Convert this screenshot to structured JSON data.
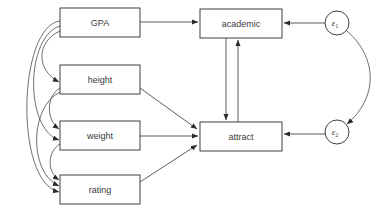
{
  "diagram": {
    "type": "path-diagram",
    "title": "",
    "background_color": "#ffffff",
    "stroke_color": "#4a4a4a",
    "text_color": "#3a3a3a",
    "box_fill": "#ffffff"
  },
  "nodes": {
    "gpa": {
      "label": "GPA",
      "shape": "rectangle",
      "x": 60,
      "y": 8,
      "w": 80,
      "h": 29
    },
    "height": {
      "label": "height",
      "shape": "rectangle",
      "x": 60,
      "y": 65,
      "w": 80,
      "h": 29
    },
    "weight": {
      "label": "weight",
      "shape": "rectangle",
      "x": 60,
      "y": 121,
      "w": 80,
      "h": 29
    },
    "rating": {
      "label": "rating",
      "shape": "rectangle",
      "x": 60,
      "y": 175,
      "w": 80,
      "h": 29
    },
    "academic": {
      "label": "academic",
      "shape": "rectangle",
      "x": 200,
      "y": 9,
      "w": 82,
      "h": 29
    },
    "attract": {
      "label": "attract",
      "shape": "rectangle",
      "x": 200,
      "y": 122,
      "w": 82,
      "h": 29
    },
    "e1": {
      "label": "ε",
      "subscript": "1",
      "shape": "circle",
      "cx": 337,
      "cy": 23,
      "r": 12
    },
    "e2": {
      "label": "ε",
      "subscript": "2",
      "shape": "circle",
      "cx": 337,
      "cy": 132,
      "r": 12
    }
  },
  "edges": {
    "directed": [
      {
        "name": "gpa-to-academic",
        "from": "gpa",
        "to": "academic"
      },
      {
        "name": "height-to-attract",
        "from": "height",
        "to": "attract"
      },
      {
        "name": "weight-to-attract",
        "from": "weight",
        "to": "attract"
      },
      {
        "name": "rating-to-attract",
        "from": "rating",
        "to": "attract"
      },
      {
        "name": "academic-to-attract",
        "from": "academic",
        "to": "attract"
      },
      {
        "name": "attract-to-academic",
        "from": "attract",
        "to": "academic"
      },
      {
        "name": "e1-to-academic",
        "from": "e1",
        "to": "academic"
      },
      {
        "name": "e2-to-attract",
        "from": "e2",
        "to": "attract"
      }
    ],
    "covariances": [
      {
        "name": "cov-gpa-height",
        "between": [
          "gpa",
          "height"
        ]
      },
      {
        "name": "cov-gpa-weight",
        "between": [
          "gpa",
          "weight"
        ]
      },
      {
        "name": "cov-gpa-rating",
        "between": [
          "gpa",
          "rating"
        ]
      },
      {
        "name": "cov-height-weight",
        "between": [
          "height",
          "weight"
        ]
      },
      {
        "name": "cov-height-rating",
        "between": [
          "height",
          "rating"
        ]
      },
      {
        "name": "cov-weight-rating",
        "between": [
          "weight",
          "rating"
        ]
      },
      {
        "name": "cov-e1-e2",
        "between": [
          "e1",
          "e2"
        ]
      }
    ]
  }
}
